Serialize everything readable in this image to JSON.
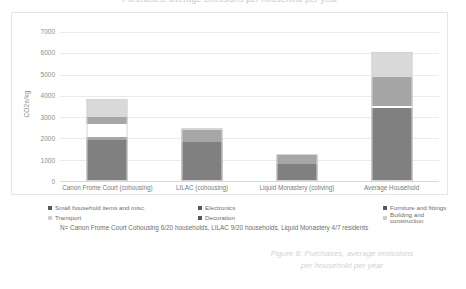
{
  "chart_data": {
    "type": "bar",
    "stacked": true,
    "title": "Purchases, average emissions per household per year",
    "xlabel": "",
    "ylabel": "CO2e/kg",
    "ylim": [
      0,
      7000
    ],
    "ytick_step": 1000,
    "yticks": [
      "7000",
      "6000",
      "5000",
      "4000",
      "3000",
      "2000",
      "1000",
      "0"
    ],
    "grid": true,
    "legend_position": "bottom",
    "categories": [
      "Canon Frome Court (cohousing)",
      "LILAC (cohousing)",
      "Liquid Monastery (coliving)",
      "Average Household"
    ],
    "series": [
      {
        "name": "Building and construction",
        "color": "#808080",
        "values": [
          1950,
          1850,
          800,
          3450
        ]
      },
      {
        "name": "Decoration",
        "color": "#a6a6a6",
        "values": [
          110,
          0,
          0,
          0
        ]
      },
      {
        "name": "Transport",
        "color": "#ffffff",
        "values": [
          620,
          0,
          0,
          90
        ]
      },
      {
        "name": "Furniture and fittings",
        "color": "#a6a6a6",
        "values": [
          340,
          560,
          420,
          1340
        ]
      },
      {
        "name": "Electronics",
        "color": "#d9d9d9",
        "values": [
          830,
          60,
          50,
          1120
        ]
      },
      {
        "name": "Small household items and misc.",
        "color": "#bfbfbf",
        "values": [
          0,
          0,
          0,
          60
        ]
      }
    ],
    "totals": [
      3850,
      2470,
      1270,
      6060
    ]
  },
  "legend": {
    "items": [
      {
        "label": "Small household items and misc.",
        "color": "#595959"
      },
      {
        "label": "Electronics",
        "color": "#595959"
      },
      {
        "label": "Furniture and fittings",
        "color": "#595959"
      },
      {
        "label": "Transport",
        "color": "#cfcfcf"
      },
      {
        "label": "Decoration",
        "color": "#595959"
      },
      {
        "label": "Building and construction",
        "color": "#cfcfcf"
      }
    ]
  },
  "footnote": {
    "text": "N= Canon Frome Court Cohousing 6/20 households, LILAC 9/20 households, Liquid Monastery 4/7 residents"
  },
  "caption": {
    "line1": "Figure 8: Purchases, average emissions",
    "line2": "per household per year"
  }
}
